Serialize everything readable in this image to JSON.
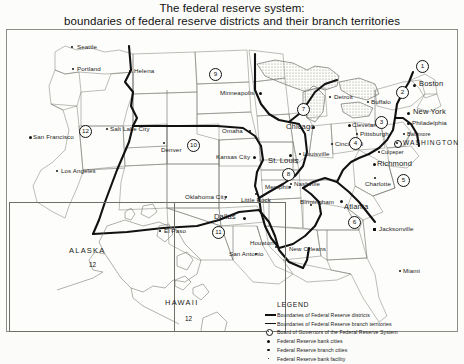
{
  "title": {
    "line1": "The federal reserve system:",
    "line2": "boundaries of federal reserve districts and their branch territories"
  },
  "legend": {
    "heading": "LEGEND",
    "items": [
      {
        "symbol": "thick-line",
        "label": "Boundaries of Federal Reserve districts"
      },
      {
        "symbol": "thin-line",
        "label": "Boundaries of Federal Reserve branch territories"
      },
      {
        "symbol": "board-of-governors-marker",
        "label": "Board of Governors of the Federal Reserve System"
      },
      {
        "symbol": "large-dot",
        "label": "Federal Reserve bank cities"
      },
      {
        "symbol": "medium-dot",
        "label": "Federal Reserve branch cities"
      },
      {
        "symbol": "small-dot",
        "label": "Federal Reserve bank facility"
      }
    ]
  },
  "districts": [
    {
      "number": "1",
      "name": "Boston",
      "x": 415,
      "y": 62
    },
    {
      "number": "2",
      "name": "New York",
      "x": 395,
      "y": 88
    },
    {
      "number": "3",
      "name": "Philadelphia",
      "x": 392,
      "y": 118
    },
    {
      "number": "4",
      "name": "Cleveland",
      "x": 348,
      "y": 139
    },
    {
      "number": "5",
      "name": "Richmond",
      "x": 396,
      "y": 176
    },
    {
      "number": "6",
      "name": "Atlanta",
      "x": 357,
      "y": 212
    },
    {
      "number": "7",
      "name": "Chicago",
      "x": 296,
      "y": 105
    },
    {
      "number": "8",
      "name": "St. Louis",
      "x": 281,
      "y": 170
    },
    {
      "number": "9",
      "name": "Minneapolis",
      "x": 208,
      "y": 70
    },
    {
      "number": "10",
      "name": "Kansas City",
      "x": 186,
      "y": 141
    },
    {
      "number": "11",
      "name": "Dallas",
      "x": 211,
      "y": 228
    },
    {
      "number": "12",
      "name": "San Francisco",
      "x": 78,
      "y": 127
    }
  ],
  "inset_districts": [
    {
      "region": "ALASKA",
      "number": "12",
      "x": 92,
      "y": 247
    },
    {
      "region": "HAWAII",
      "number": "12",
      "x": 188,
      "y": 309
    }
  ],
  "cities": [
    {
      "name": "Seattle",
      "type": "branch",
      "x": 75,
      "y": 46
    },
    {
      "name": "Portland",
      "type": "branch",
      "x": 76,
      "y": 68
    },
    {
      "name": "Helena",
      "type": "facility",
      "x": 129,
      "y": 70
    },
    {
      "name": "Salt Lake City",
      "type": "branch",
      "x": 106,
      "y": 130
    },
    {
      "name": "San Francisco",
      "type": "bank",
      "x": 32,
      "y": 140
    },
    {
      "name": "Los Angeles",
      "type": "branch",
      "x": 57,
      "y": 170
    },
    {
      "name": "Denver",
      "type": "branch",
      "x": 159,
      "y": 148
    },
    {
      "name": "Minneapolis",
      "type": "bank",
      "x": 222,
      "y": 92
    },
    {
      "name": "Omaha",
      "type": "branch",
      "x": 224,
      "y": 129
    },
    {
      "name": "Kansas City",
      "type": "bank",
      "x": 218,
      "y": 155
    },
    {
      "name": "Oklahoma City",
      "type": "branch",
      "x": 187,
      "y": 195
    },
    {
      "name": "El Paso",
      "type": "branch",
      "x": 164,
      "y": 229
    },
    {
      "name": "Dallas",
      "type": "bank",
      "x": 216,
      "y": 216
    },
    {
      "name": "San Antonio",
      "type": "branch",
      "x": 230,
      "y": 255
    },
    {
      "name": "Houston",
      "type": "branch",
      "x": 250,
      "y": 242
    },
    {
      "name": "Little Rock",
      "type": "branch",
      "x": 241,
      "y": 199
    },
    {
      "name": "St. Louis",
      "type": "bank",
      "x": 271,
      "y": 160
    },
    {
      "name": "Memphis",
      "type": "branch",
      "x": 266,
      "y": 186
    },
    {
      "name": "Louisville",
      "type": "branch",
      "x": 303,
      "y": 153
    },
    {
      "name": "Nashville",
      "type": "branch",
      "x": 294,
      "y": 183
    },
    {
      "name": "New Orleans",
      "type": "branch",
      "x": 288,
      "y": 249
    },
    {
      "name": "Birmingham",
      "type": "branch",
      "x": 308,
      "y": 201
    },
    {
      "name": "Atlanta",
      "type": "bank",
      "x": 348,
      "y": 206
    },
    {
      "name": "Jacksonville",
      "type": "branch",
      "x": 378,
      "y": 228
    },
    {
      "name": "Miami",
      "type": "branch",
      "x": 404,
      "y": 270
    },
    {
      "name": "Chicago",
      "type": "bank",
      "x": 290,
      "y": 126
    },
    {
      "name": "Detroit",
      "type": "branch",
      "x": 334,
      "y": 96
    },
    {
      "name": "Cleveland",
      "type": "bank",
      "x": 357,
      "y": 124
    },
    {
      "name": "Pittsburgh",
      "type": "branch",
      "x": 359,
      "y": 133
    },
    {
      "name": "Cincinnati",
      "type": "branch",
      "x": 336,
      "y": 143
    },
    {
      "name": "Buffalo",
      "type": "branch",
      "x": 373,
      "y": 101
    },
    {
      "name": "Boston",
      "type": "bank",
      "x": 419,
      "y": 83
    },
    {
      "name": "New York",
      "type": "bank",
      "x": 415,
      "y": 111
    },
    {
      "name": "Philadelphia",
      "type": "bank",
      "x": 413,
      "y": 122
    },
    {
      "name": "Baltimore",
      "type": "branch",
      "x": 405,
      "y": 133
    },
    {
      "name": "WASHINGTON",
      "type": "board",
      "x": 400,
      "y": 143
    },
    {
      "name": "Culpeper",
      "type": "facility",
      "x": 381,
      "y": 151
    },
    {
      "name": "Richmond",
      "type": "bank",
      "x": 379,
      "y": 163
    },
    {
      "name": "Charlotte",
      "type": "branch",
      "x": 366,
      "y": 183
    }
  ],
  "insets": [
    {
      "name": "ALASKA"
    },
    {
      "name": "HAWAII"
    }
  ]
}
